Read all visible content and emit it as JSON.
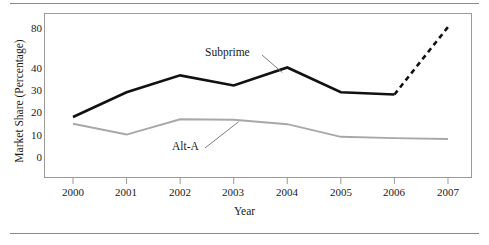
{
  "figure": {
    "top_rule": "horizontal-rule",
    "bottom_rule": "horizontal-rule",
    "background": "#ffffff"
  },
  "chart_data": {
    "type": "line",
    "title": "",
    "xlabel": "Year",
    "ylabel": "Market Share (Percentage)",
    "categories": [
      "2000",
      "2001",
      "2002",
      "2003",
      "2004",
      "2005",
      "2006",
      "2007"
    ],
    "x": [
      2000,
      2001,
      2002,
      2003,
      2004,
      2005,
      2006,
      2007
    ],
    "yticks": [
      0,
      10,
      20,
      30,
      40,
      80
    ],
    "ytick_labels": [
      "0",
      "10",
      "20",
      "30",
      "40",
      "80"
    ],
    "ylim": [
      0,
      80
    ],
    "y_axis_note": "non-linear: break between 40 and 80",
    "grid": false,
    "legend": "inline-annotations",
    "series": [
      {
        "name": "Subprime",
        "color": "#111111",
        "width": 2.6,
        "values": [
          18,
          29,
          36.5,
          32,
          40,
          29,
          28,
          81
        ],
        "solid_through": 2006,
        "dashed_from": 2006,
        "dashed_to": 2007
      },
      {
        "name": "Alt-A",
        "color": "#a8a8a8",
        "width": 1.9,
        "values": [
          15,
          10.2,
          17,
          16.8,
          14.8,
          9.2,
          8.6,
          8.2
        ]
      }
    ],
    "annotations": [
      {
        "text": "Subprime",
        "target_year": 2004,
        "target_value": 40
      },
      {
        "text": "Alt-A",
        "target_year": 2003,
        "target_value": 16.8
      }
    ]
  },
  "axis": {
    "x_ticks": [
      "2000",
      "2001",
      "2002",
      "2003",
      "2004",
      "2005",
      "2006",
      "2007"
    ],
    "y_ticks": [
      "80",
      "40",
      "30",
      "20",
      "10",
      "0"
    ]
  }
}
